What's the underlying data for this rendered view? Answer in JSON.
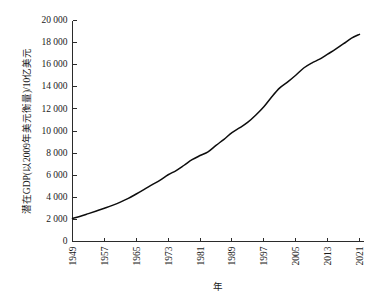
{
  "chart_data": {
    "type": "line",
    "title": "",
    "subtitle": "",
    "xlabel": "年",
    "ylabel": "潜在GDP(以2009年美元衡量)/10亿美元",
    "xlim": [
      1949,
      2022
    ],
    "ylim": [
      0,
      20000
    ],
    "grid": false,
    "legend": null,
    "legend_position": "none",
    "annotations": [],
    "x_tick_labels": [
      "1949",
      "1957",
      "1965",
      "1973",
      "1981",
      "1989",
      "1997",
      "2005",
      "2013",
      "2021"
    ],
    "x_tick_values": [
      1949,
      1957,
      1965,
      1973,
      1981,
      1989,
      1997,
      2005,
      2013,
      2021
    ],
    "y_tick_labels": [
      "0",
      "2 000",
      "4 000",
      "6 000",
      "8 000",
      "10 000",
      "12 000",
      "14 000",
      "16 000",
      "18 000",
      "20 000"
    ],
    "y_tick_values": [
      0,
      2000,
      4000,
      6000,
      8000,
      10000,
      12000,
      14000,
      16000,
      18000,
      20000
    ],
    "series": [
      {
        "name": "潜在GDP",
        "color": "#0d0d0d",
        "x": [
          1949,
          1951,
          1953,
          1955,
          1957,
          1959,
          1961,
          1963,
          1965,
          1967,
          1969,
          1971,
          1973,
          1975,
          1977,
          1979,
          1981,
          1983,
          1985,
          1987,
          1989,
          1991,
          1993,
          1995,
          1997,
          1999,
          2001,
          2003,
          2005,
          2007,
          2009,
          2011,
          2013,
          2015,
          2017,
          2019,
          2021
        ],
        "values": [
          2080,
          2280,
          2520,
          2760,
          3010,
          3270,
          3560,
          3900,
          4300,
          4720,
          5150,
          5560,
          6040,
          6420,
          6900,
          7400,
          7780,
          8120,
          8700,
          9250,
          9850,
          10300,
          10800,
          11450,
          12200,
          13100,
          13900,
          14450,
          15050,
          15700,
          16150,
          16500,
          16950,
          17400,
          17900,
          18400,
          18750
        ]
      }
    ]
  }
}
